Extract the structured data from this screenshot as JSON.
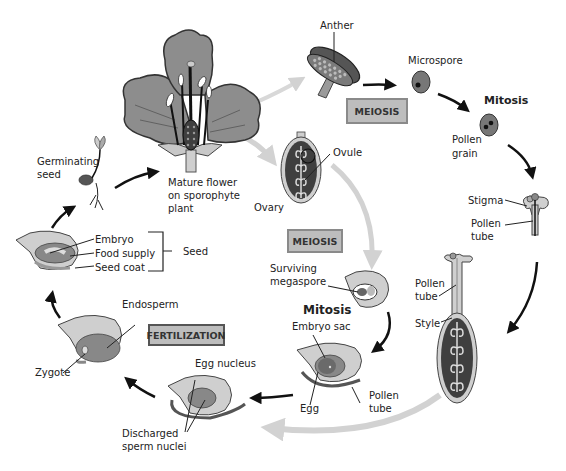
{
  "diagram": {
    "colors": {
      "dark_tissue": "#3f3f3f",
      "mid_gray": "#8a8a8a",
      "light_gray": "#c8c8c8",
      "pale": "#dcdcdc",
      "arrow_dark": "#111111",
      "arrow_light": "#d2d2d2",
      "box_fill": "#bdbdbd",
      "box_border": "#8a8a8a"
    },
    "stages": {
      "flower": {
        "label_1": "Mature flower",
        "label_2": "on sporophyte",
        "label_3": "plant"
      },
      "anther": {
        "label": "Anther"
      },
      "microspore": {
        "label": "Microspore"
      },
      "mitosis_male": {
        "label": "Mitosis"
      },
      "pollen_grain": {
        "label_1": "Pollen",
        "label_2": "grain"
      },
      "stigma": {
        "label": "Stigma"
      },
      "pollen_tube_top": {
        "label_1": "Pollen",
        "label_2": "tube"
      },
      "pollen_tube_mid": {
        "label_1": "Pollen",
        "label_2": "tube"
      },
      "style": {
        "label": "Style"
      },
      "ovary": {
        "label": "Ovary"
      },
      "ovule": {
        "label": "Ovule"
      },
      "megaspore": {
        "label_1": "Surviving",
        "label_2": "megaspore"
      },
      "mitosis_female": {
        "label": "Mitosis"
      },
      "embryo_sac": {
        "label": "Embryo sac"
      },
      "egg": {
        "label": "Egg"
      },
      "pollen_tube_bottom": {
        "label_1": "Pollen",
        "label_2": "tube"
      },
      "egg_nucleus": {
        "label": "Egg nucleus"
      },
      "sperm_nuclei": {
        "label_1": "Discharged",
        "label_2": "sperm nuclei"
      },
      "endosperm": {
        "label": "Endosperm"
      },
      "zygote": {
        "label": "Zygote"
      },
      "seed": {
        "embryo": "Embryo",
        "food_supply": "Food supply",
        "seed_coat": "Seed coat",
        "bracket_label": "Seed"
      },
      "germinating_seed": {
        "label_1": "Germinating",
        "label_2": "seed"
      }
    },
    "process_boxes": {
      "meiosis_male": "MEIOSIS",
      "meiosis_female": "MEIOSIS",
      "fertilization": "FERTILIZATION"
    }
  }
}
